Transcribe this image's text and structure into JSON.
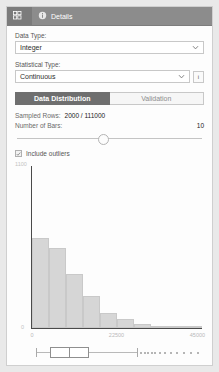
{
  "header": {
    "tabs": [
      {
        "label": "",
        "icon": "grid-icon",
        "selected": true
      },
      {
        "label": "Details",
        "icon": "info-circle-icon",
        "selected": false
      }
    ]
  },
  "form": {
    "data_type_label": "Data Type:",
    "data_type_value": "Integer",
    "statistical_type_label": "Statistical Type:",
    "statistical_type_value": "Continuous",
    "info_button_label": "i"
  },
  "tabs": [
    {
      "label": "Data Distribution",
      "active": true
    },
    {
      "label": "Validation",
      "active": false
    }
  ],
  "stats": {
    "sampled_rows_label": "Sampled Rows:",
    "sampled_rows_value": "2000 / 111000",
    "number_of_bars_label": "Number of Bars:",
    "number_of_bars_value": "10"
  },
  "slider": {
    "value": 10,
    "min": 1,
    "max": 22,
    "position_pct": 44
  },
  "checkbox": {
    "label": "Include outliers",
    "checked": true
  },
  "chart_data": {
    "type": "bar",
    "title": "",
    "xlabel": "",
    "ylabel": "",
    "ylim": [
      0,
      1100
    ],
    "ytick_labels": [
      "1100",
      "0"
    ],
    "xtick_labels": [
      "0",
      "22500",
      "45000"
    ],
    "xtick_positions_pct": [
      0,
      50,
      100
    ],
    "categories": [
      "0",
      "4500",
      "9000",
      "13500",
      "18000",
      "22500",
      "27000",
      "31500",
      "36000",
      "40500"
    ],
    "values": [
      610,
      540,
      370,
      215,
      105,
      62,
      30,
      14,
      8,
      4
    ],
    "grid": false,
    "legend": null
  },
  "boxplot": {
    "whisker_min_pct": 3,
    "q1_pct": 11,
    "median_pct": 22,
    "q3_pct": 34,
    "whisker_max_pct": 62,
    "outliers_pct": [
      64,
      66,
      68,
      70,
      72,
      75,
      78,
      81,
      85,
      89,
      93,
      97
    ]
  }
}
